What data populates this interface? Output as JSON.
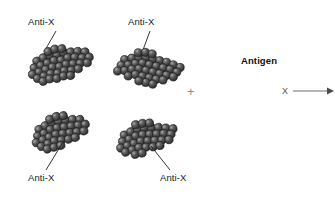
{
  "figure": {
    "title_visible": false,
    "background_color": "#ffffff",
    "width": 335,
    "height": 216
  },
  "labels": {
    "antibody_top_left": "Anti-X",
    "antibody_top_right": "Anti-X",
    "antibody_bottom_left": "Anti-X",
    "antibody_bottom_right": "Anti-X",
    "antigen_heading": "Antigen",
    "antigen_symbol": "X",
    "plus_sign": "+"
  },
  "icons": {
    "cluster": "antibody-cluster-icon",
    "arrow": "right-arrow-icon",
    "leader": "leader-line-icon"
  },
  "colors": {
    "sphere_fill": "#4a4a4a",
    "sphere_edge": "#1c1c1c",
    "sphere_highlight": "#9b9b9b",
    "text": "#1a1a1a",
    "plus": "#8d8d8d",
    "arrow": "#6f6f6f",
    "antigen_x": "#555555",
    "leader_line": "#1f1f1f"
  },
  "clusters": [
    {
      "name": "antibody-cluster-top-left",
      "x": 28,
      "y": 47,
      "w": 62,
      "h": 30,
      "rotate": -12,
      "sphere_count": 46,
      "sphere_radius": 4.1
    },
    {
      "name": "antibody-cluster-top-right",
      "x": 118,
      "y": 52,
      "w": 64,
      "h": 28,
      "rotate": 6,
      "sphere_count": 46,
      "sphere_radius": 4.1
    },
    {
      "name": "antibody-cluster-bottom-left",
      "x": 32,
      "y": 113,
      "w": 58,
      "h": 28,
      "rotate": -14,
      "sphere_count": 42,
      "sphere_radius": 4.1
    },
    {
      "name": "antibody-cluster-bottom-right",
      "x": 117,
      "y": 120,
      "w": 60,
      "h": 28,
      "rotate": -10,
      "sphere_count": 42,
      "sphere_radius": 4.1
    }
  ],
  "leaders": [
    {
      "name": "leader-top-left",
      "x1": 56,
      "y1": 31,
      "x2": 44,
      "y2": 52
    },
    {
      "name": "leader-top-right",
      "x1": 150,
      "y1": 31,
      "x2": 140,
      "y2": 58
    },
    {
      "name": "leader-bottom-left",
      "x1": 63,
      "y1": 142,
      "x2": 46,
      "y2": 170
    },
    {
      "name": "leader-bottom-right",
      "x1": 155,
      "y1": 146,
      "x2": 172,
      "y2": 170
    }
  ],
  "arrow": {
    "name": "antigen-arrow",
    "x1": 293,
    "y1": 91,
    "x2": 331,
    "y2": 91
  }
}
